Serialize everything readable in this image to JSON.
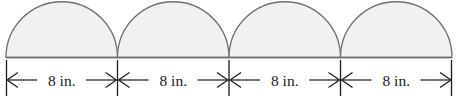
{
  "figure": {
    "name": "four-semicircles-on-baseline-with-dimensions",
    "canvas": {
      "width": 461,
      "height": 100
    },
    "colors": {
      "background": "#ffffff",
      "shape_fill": "#f1f1f1",
      "shape_stroke": "#6f6f6f",
      "baseline_stroke": "#6f6f6f",
      "dimension_stroke": "#1a1a1a",
      "label_text": "#1a1a1a"
    },
    "geometry": {
      "baseline_y": 57.5,
      "baseline_x_start": 6,
      "baseline_x_end": 452,
      "segment_width": 111.5,
      "semicircle_radius": 55.75,
      "apex_y": 2,
      "dimension_line_y": 80,
      "tick_top_y": 60,
      "tick_bottom_y": 96,
      "junctions": [
        6,
        117.5,
        229,
        340.5,
        452
      ]
    },
    "shapes": [
      {
        "id": "semicircle-1",
        "center_x": 61.75,
        "radius": 55.75
      },
      {
        "id": "semicircle-2",
        "center_x": 173.25,
        "radius": 55.75
      },
      {
        "id": "semicircle-3",
        "center_x": 284.75,
        "radius": 55.75
      },
      {
        "id": "semicircle-4",
        "center_x": 396.25,
        "radius": 55.75
      }
    ],
    "dimensions": [
      {
        "id": "dimension-1",
        "label": "8 in.",
        "x_start": 6,
        "x_end": 117.5,
        "center_x": 61.75
      },
      {
        "id": "dimension-2",
        "label": "8 in.",
        "x_start": 117.5,
        "x_end": 229,
        "center_x": 173.25
      },
      {
        "id": "dimension-3",
        "label": "8 in.",
        "x_start": 229,
        "x_end": 340.5,
        "center_x": 284.75
      },
      {
        "id": "dimension-4",
        "label": "8 in.",
        "x_start": 340.5,
        "x_end": 452,
        "center_x": 396.25
      }
    ],
    "ticks": [
      {
        "id": "tick-1",
        "x": 6
      },
      {
        "id": "tick-2",
        "x": 117.5
      },
      {
        "id": "tick-3",
        "x": 229
      },
      {
        "id": "tick-4",
        "x": 340.5
      },
      {
        "id": "tick-5",
        "x": 452
      }
    ]
  }
}
